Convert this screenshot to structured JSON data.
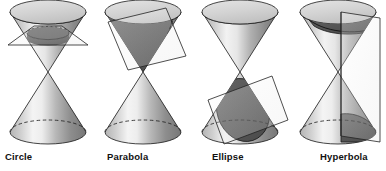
{
  "figure": {
    "background_color": "#ffffff",
    "width": 386,
    "height": 171,
    "outline_color": "#1a1a1a",
    "cut_region_color": "#585858",
    "cone_light_color": "#f2f2f2",
    "cone_mid_color": "#9a9a9a",
    "cone_dark_color": "#6e6e6e",
    "top_ellipse_color": "#d8d8d8",
    "plane_edge_color": "#222222"
  },
  "panels": [
    {
      "id": "circle",
      "label": "Circle",
      "label_x": 5,
      "label_y": 155,
      "center_x": 48,
      "plane_type": "horizontal",
      "plane_description": "horizontal plane perpendicular to the cone axis",
      "cut_curve": "circle",
      "cut_on_nappe": "upper"
    },
    {
      "id": "parabola",
      "label": "Parabola",
      "label_x": 107,
      "label_y": 155,
      "center_x": 143,
      "plane_type": "tilted-parallel-to-slant",
      "plane_description": "plane parallel to one slant side of the cone",
      "cut_curve": "parabola",
      "cut_on_nappe": "upper"
    },
    {
      "id": "ellipse",
      "label": "Ellipse",
      "label_x": 212,
      "label_y": 155,
      "center_x": 240,
      "plane_type": "oblique",
      "plane_description": "oblique plane cutting entirely through one nappe",
      "cut_curve": "ellipse",
      "cut_on_nappe": "lower"
    },
    {
      "id": "hyperbola",
      "label": "Hyperbola",
      "label_x": 320,
      "label_y": 155,
      "center_x": 338,
      "plane_type": "vertical",
      "plane_description": "vertical plane parallel to the cone axis cutting both nappes",
      "cut_curve": "hyperbola",
      "cut_on_nappe": "both"
    }
  ]
}
